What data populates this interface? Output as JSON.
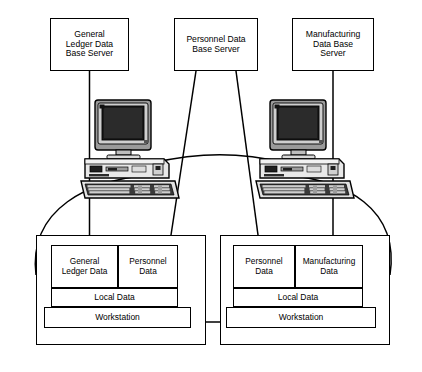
{
  "diagram": {
    "background_color": "#ffffff",
    "line_color": "#000000",
    "servers": [
      {
        "id": "general-ledger-server",
        "label": "General\nLedger Data\nBase Server",
        "x": 50,
        "y": 18,
        "w": 79,
        "h": 53
      },
      {
        "id": "personnel-server",
        "label": "Personnel Data\nBase Server",
        "x": 174,
        "y": 18,
        "w": 84,
        "h": 53
      },
      {
        "id": "manufacturing-server",
        "label": "Manufacturing\nData Base\nServer",
        "x": 292,
        "y": 18,
        "w": 82,
        "h": 53
      }
    ],
    "computers": [
      {
        "id": "computer-left",
        "name": "desktop-computer-icon",
        "x": 78,
        "y": 99,
        "w": 104,
        "h": 104
      },
      {
        "id": "computer-right",
        "name": "desktop-computer-icon",
        "x": 253,
        "y": 99,
        "w": 104,
        "h": 104
      }
    ],
    "panels": [
      {
        "id": "workstation-panel-left",
        "x": 36,
        "y": 235,
        "w": 170,
        "h": 110,
        "data_cells": [
          {
            "id": "cell-general-ledger-data",
            "label": "General\nLedger Data"
          },
          {
            "id": "cell-personnel-data",
            "label": "Personnel\nData"
          }
        ],
        "local_label": "Local Data",
        "workstation_label": "Workstation"
      },
      {
        "id": "workstation-panel-right",
        "x": 220,
        "y": 235,
        "w": 170,
        "h": 110,
        "data_cells": [
          {
            "id": "cell-personnel-data-right",
            "label": "Personnel\nData"
          },
          {
            "id": "cell-manufacturing-data",
            "label": "Manufacturing\nData"
          }
        ],
        "local_label": "Local Data",
        "workstation_label": "Workstation"
      }
    ],
    "connections": [
      {
        "id": "link-gl-server-to-left-panel",
        "type": "vertical"
      },
      {
        "id": "link-personnel-server-to-left-panel",
        "type": "diagonal"
      },
      {
        "id": "link-personnel-server-to-right-panel",
        "type": "diagonal"
      },
      {
        "id": "link-mfg-server-to-right-panel",
        "type": "vertical"
      },
      {
        "id": "link-computer-left-to-computer-right",
        "type": "arc"
      },
      {
        "id": "link-computer-left-to-left-panel",
        "type": "arc"
      },
      {
        "id": "link-computer-right-to-right-panel",
        "type": "arc"
      },
      {
        "id": "link-left-panel-to-right-panel",
        "type": "horizontal"
      }
    ]
  }
}
